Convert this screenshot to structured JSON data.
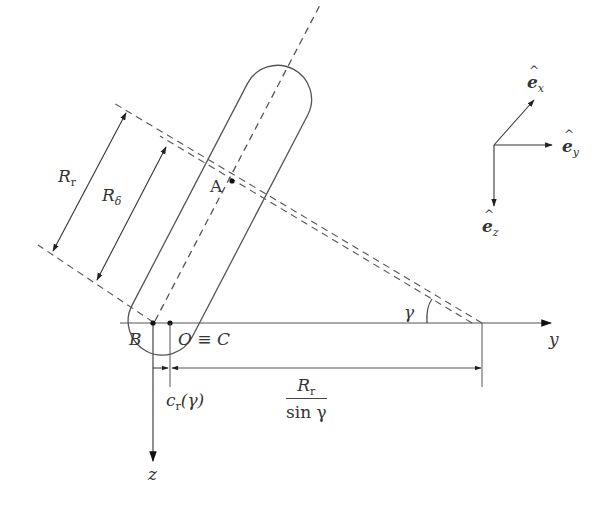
{
  "diagram": {
    "type": "tire-contact-geometry",
    "axes": {
      "y_label": "y",
      "z_label": "z"
    },
    "points": {
      "A": "A",
      "B": "B",
      "O_C": "O ≡ C"
    },
    "dimensions": {
      "R_r": {
        "base": "R",
        "sub": "r"
      },
      "R_delta": {
        "base": "R",
        "sub": "δ"
      },
      "c_r": {
        "base": "c",
        "sub": "r",
        "arg": "(γ)"
      },
      "R_r_over_sin": {
        "num_base": "R",
        "num_sub": "r",
        "den": "sin γ"
      }
    },
    "angle": {
      "label": "γ"
    },
    "unit_vectors": {
      "ex": {
        "base": "e",
        "sub": "x"
      },
      "ey": {
        "base": "e",
        "sub": "y"
      },
      "ez": {
        "base": "e",
        "sub": "z"
      }
    }
  }
}
